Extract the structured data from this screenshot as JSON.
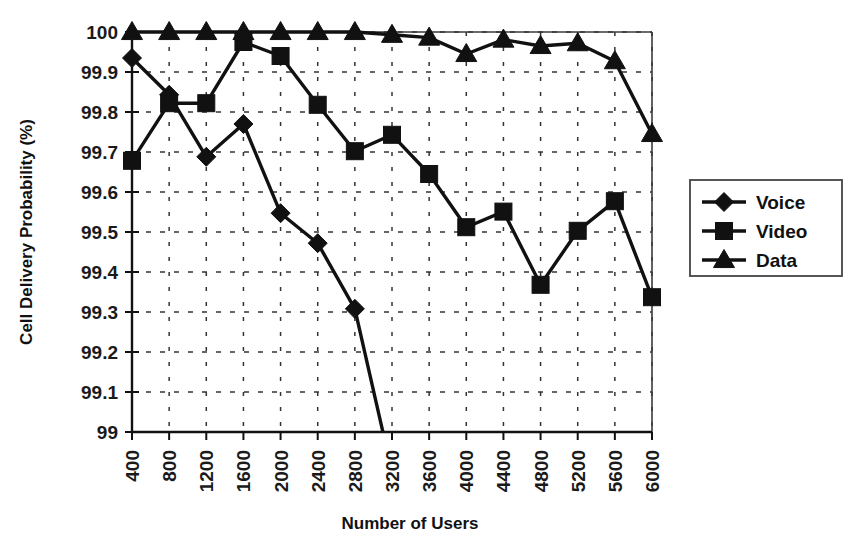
{
  "chart_data": {
    "type": "line",
    "title": "",
    "xlabel": "Number of Users",
    "ylabel": "Cell Delivery Probability (%)",
    "categories": [
      400,
      800,
      1200,
      1600,
      2000,
      2400,
      2800,
      3200,
      3600,
      4000,
      4400,
      4800,
      5200,
      5600,
      6000
    ],
    "x_tick_labels": [
      "400",
      "800",
      "1200",
      "1600",
      "2000",
      "2400",
      "2800",
      "3200",
      "3600",
      "4000",
      "4400",
      "4800",
      "5200",
      "5600",
      "6000"
    ],
    "y_tick_labels": [
      "99",
      "99.1",
      "99.2",
      "99.3",
      "99.4",
      "99.5",
      "99.6",
      "99.7",
      "99.8",
      "99.9",
      "100"
    ],
    "y_ticks": [
      99,
      99.1,
      99.2,
      99.3,
      99.4,
      99.5,
      99.6,
      99.7,
      99.8,
      99.9,
      100
    ],
    "ylim": [
      99,
      100
    ],
    "xlim": [
      400,
      6000
    ],
    "grid": true,
    "grid_style": "dotted",
    "legend_position": "right-outside",
    "series": [
      {
        "name": "Voice",
        "marker": "diamond",
        "color": "#111111",
        "values": [
          99.935,
          99.843,
          99.688,
          99.77,
          99.547,
          99.472,
          99.308,
          98.9,
          null,
          null,
          null,
          null,
          null,
          null,
          null
        ]
      },
      {
        "name": "Video",
        "marker": "square",
        "color": "#111111",
        "values": [
          99.678,
          99.822,
          99.822,
          99.975,
          99.94,
          99.818,
          99.702,
          99.743,
          99.645,
          99.512,
          99.551,
          99.368,
          99.503,
          99.577,
          99.337
        ]
      },
      {
        "name": "Data",
        "marker": "triangle",
        "color": "#111111",
        "values": [
          100.0,
          100.0,
          100.0,
          100.0,
          100.0,
          100.0,
          100.0,
          99.993,
          99.986,
          99.945,
          99.981,
          99.965,
          99.972,
          99.927,
          99.745
        ]
      }
    ]
  },
  "legend": {
    "items": [
      {
        "label": "Voice",
        "marker": "diamond"
      },
      {
        "label": "Video",
        "marker": "square"
      },
      {
        "label": "Data",
        "marker": "triangle"
      }
    ]
  },
  "axes": {
    "x_title": "Number of Users",
    "y_title": "Cell Delivery Probability (%)"
  }
}
